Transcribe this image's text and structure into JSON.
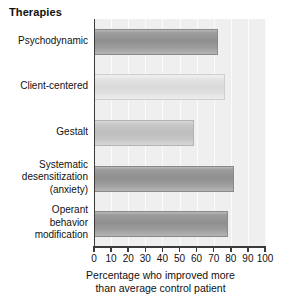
{
  "chart_data": {
    "type": "bar",
    "orientation": "horizontal",
    "title": "Therapies",
    "xlabel": "Percentage who improved more than average control patient",
    "xlabel_line1": "Percentage who improved more",
    "xlabel_line2": "than average control patient",
    "ylabel": "",
    "categories": [
      "Psychodynamic",
      "Client-centered",
      "Gestalt",
      "Systematic desensitization (anxiety)",
      "Operant behavior modification"
    ],
    "category_lines": [
      [
        "Psychodynamic"
      ],
      [
        "Client-centered"
      ],
      [
        "Gestalt"
      ],
      [
        "Systematic",
        "desensitization",
        "(anxiety)"
      ],
      [
        "Operant",
        "behavior",
        "modification"
      ]
    ],
    "values": [
      72,
      76,
      58,
      81,
      78
    ],
    "bar_shades": [
      "dark",
      "light",
      "mid",
      "dark",
      "dark"
    ],
    "xlim": [
      0,
      100
    ],
    "xticks": [
      0,
      10,
      20,
      30,
      40,
      50,
      60,
      70,
      80,
      90,
      100
    ],
    "xtick_labels": [
      "0",
      "10",
      "20",
      "30",
      "40",
      "50",
      "60",
      "70",
      "80",
      "90",
      "100"
    ],
    "grid": true,
    "legend": null,
    "plot_background": "#efefef",
    "axis_color": "#3b3b3b"
  }
}
